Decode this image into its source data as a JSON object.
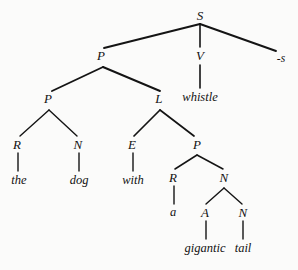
{
  "figure": {
    "background_color": "#fbfbfa",
    "ink_color": "#141414",
    "width": 298,
    "height": 270
  },
  "sentence": "the dog with a gigantic tail whistle-s",
  "nodes": [
    {
      "id": "s",
      "label": "S",
      "kind": "category",
      "x": 200,
      "y": 15
    },
    {
      "id": "p1",
      "label": "P",
      "kind": "category",
      "x": 101,
      "y": 55
    },
    {
      "id": "v",
      "label": "V",
      "kind": "category",
      "x": 200,
      "y": 55
    },
    {
      "id": "suffix_s",
      "label": "-s",
      "kind": "word",
      "x": 281,
      "y": 59
    },
    {
      "id": "whistle",
      "label": "whistle",
      "kind": "word",
      "x": 200,
      "y": 97
    },
    {
      "id": "p2",
      "label": "P",
      "kind": "category",
      "x": 48,
      "y": 98
    },
    {
      "id": "l",
      "label": "L",
      "kind": "category",
      "x": 159,
      "y": 98
    },
    {
      "id": "r1",
      "label": "R",
      "kind": "category",
      "x": 17,
      "y": 144
    },
    {
      "id": "n1",
      "label": "N",
      "kind": "category",
      "x": 78,
      "y": 144
    },
    {
      "id": "e",
      "label": "E",
      "kind": "category",
      "x": 132,
      "y": 144
    },
    {
      "id": "p3",
      "label": "P",
      "kind": "category",
      "x": 197,
      "y": 144
    },
    {
      "id": "the",
      "label": "the",
      "kind": "word",
      "x": 19,
      "y": 180
    },
    {
      "id": "dog",
      "label": "dog",
      "kind": "word",
      "x": 79,
      "y": 180
    },
    {
      "id": "with",
      "label": "with",
      "kind": "word",
      "x": 133,
      "y": 180
    },
    {
      "id": "r2",
      "label": "R",
      "kind": "category",
      "x": 173,
      "y": 177
    },
    {
      "id": "n2",
      "label": "N",
      "kind": "category",
      "x": 224,
      "y": 177
    },
    {
      "id": "a",
      "label": "a",
      "kind": "word",
      "x": 173,
      "y": 212
    },
    {
      "id": "adj",
      "label": "A",
      "kind": "category",
      "x": 205,
      "y": 212
    },
    {
      "id": "n3",
      "label": "N",
      "kind": "category",
      "x": 243,
      "y": 212
    },
    {
      "id": "gigantic",
      "label": "gigantic",
      "kind": "word",
      "x": 205,
      "y": 248
    },
    {
      "id": "tail",
      "label": "tail",
      "kind": "word",
      "x": 243,
      "y": 248
    }
  ],
  "edges": [
    {
      "from": "s",
      "to": "p1",
      "x1": 200,
      "y1": 24,
      "x2": 104,
      "y2": 48,
      "weight": 1.9
    },
    {
      "from": "s",
      "to": "v",
      "x1": 200,
      "y1": 24,
      "x2": 200,
      "y2": 47,
      "weight": 1.6
    },
    {
      "from": "s",
      "to": "suffix_s",
      "x1": 200,
      "y1": 24,
      "x2": 276,
      "y2": 51,
      "weight": 1.9
    },
    {
      "from": "v",
      "to": "whistle",
      "x1": 200,
      "y1": 65,
      "x2": 200,
      "y2": 88,
      "weight": 1.6
    },
    {
      "from": "p1",
      "to": "p2",
      "x1": 103,
      "y1": 67,
      "x2": 52,
      "y2": 91,
      "weight": 1.9
    },
    {
      "from": "p1",
      "to": "l",
      "x1": 103,
      "y1": 67,
      "x2": 160,
      "y2": 91,
      "weight": 1.9
    },
    {
      "from": "p2",
      "to": "r1",
      "x1": 49,
      "y1": 110,
      "x2": 20,
      "y2": 136,
      "weight": 1.4
    },
    {
      "from": "p2",
      "to": "n1",
      "x1": 49,
      "y1": 110,
      "x2": 77,
      "y2": 136,
      "weight": 1.4
    },
    {
      "from": "l",
      "to": "e",
      "x1": 160,
      "y1": 110,
      "x2": 134,
      "y2": 136,
      "weight": 1.7
    },
    {
      "from": "l",
      "to": "p3",
      "x1": 160,
      "y1": 110,
      "x2": 194,
      "y2": 136,
      "weight": 1.7
    },
    {
      "from": "r1",
      "to": "the",
      "x1": 18,
      "y1": 153,
      "x2": 18,
      "y2": 171,
      "weight": 1.4
    },
    {
      "from": "n1",
      "to": "dog",
      "x1": 79,
      "y1": 153,
      "x2": 79,
      "y2": 171,
      "weight": 1.4
    },
    {
      "from": "e",
      "to": "with",
      "x1": 133,
      "y1": 153,
      "x2": 133,
      "y2": 171,
      "weight": 1.4
    },
    {
      "from": "p3",
      "to": "r2",
      "x1": 197,
      "y1": 155,
      "x2": 175,
      "y2": 169,
      "weight": 1.5
    },
    {
      "from": "p3",
      "to": "n2",
      "x1": 197,
      "y1": 155,
      "x2": 223,
      "y2": 169,
      "weight": 1.5
    },
    {
      "from": "r2",
      "to": "a",
      "x1": 174,
      "y1": 186,
      "x2": 174,
      "y2": 204,
      "weight": 1.4
    },
    {
      "from": "n2",
      "to": "adj",
      "x1": 224,
      "y1": 188,
      "x2": 206,
      "y2": 204,
      "weight": 1.4
    },
    {
      "from": "n2",
      "to": "n3",
      "x1": 224,
      "y1": 188,
      "x2": 242,
      "y2": 204,
      "weight": 1.4
    },
    {
      "from": "adj",
      "to": "gigantic",
      "x1": 206,
      "y1": 221,
      "x2": 206,
      "y2": 239,
      "weight": 1.4
    },
    {
      "from": "n3",
      "to": "tail",
      "x1": 243,
      "y1": 221,
      "x2": 243,
      "y2": 239,
      "weight": 1.4
    }
  ]
}
